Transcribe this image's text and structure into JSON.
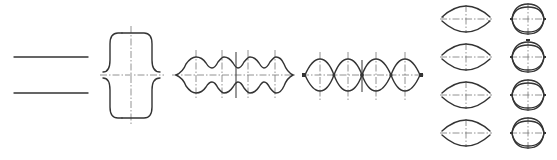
{
  "diagram": {
    "title": "",
    "background": "#ffffff",
    "stroke_color": "#333333",
    "centerline_color": "#777777",
    "figures": [
      {
        "id": "parallel-lines",
        "type": "two-horizontal-lines",
        "x1": 14,
        "x2": 88,
        "y_top": 57,
        "y_bottom": 93
      },
      {
        "id": "bracket-shape",
        "type": "curly-brace-pair",
        "cx": 131,
        "cy": 75,
        "left": 103,
        "right": 160,
        "top": 33,
        "bottom": 118
      },
      {
        "id": "wavy-beam",
        "type": "four-lobe-wave",
        "x_start": 176,
        "x_end": 293,
        "cy": 75,
        "lobe_centers": [
          196,
          222,
          248,
          275
        ],
        "peak_offset": 18,
        "valley_offset": 7
      },
      {
        "id": "lens-chain",
        "type": "four-lens-chain",
        "x_start": 305,
        "x_end": 420,
        "cy": 75,
        "nodes": [
          305,
          334,
          362,
          391,
          420
        ],
        "half_height": 16
      }
    ],
    "small_shapes": {
      "rows_cy": [
        19,
        57,
        95,
        133
      ],
      "left_column": {
        "cx": 466,
        "half_width": 24,
        "arc_offset": 11,
        "gap": 3
      },
      "right_column": {
        "cx": 528,
        "half_width": 16,
        "half_height": 14
      }
    }
  }
}
